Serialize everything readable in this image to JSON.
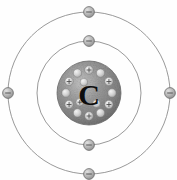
{
  "diagram": {
    "element_symbol": "C",
    "element_name": "Carbon",
    "background_color": "#fefefe",
    "canvas": {
      "width": 177,
      "height": 180
    },
    "center": {
      "x": 89,
      "y": 93
    }
  },
  "nucleus": {
    "label": "C",
    "radius": 32,
    "fill_color": "#8e8e8e",
    "edge_color": "#6f6f6f",
    "proton_count": 6,
    "neutron_count": 6,
    "proton_sign": "+",
    "nucleon_ring_radius": 23,
    "nucleon_radius": 4.2,
    "nucleon_fill": "#d6d6d6",
    "nucleons": [
      {
        "type": "proton",
        "angle": -90,
        "sign": "+"
      },
      {
        "type": "neutron",
        "angle": -60,
        "sign": ""
      },
      {
        "type": "proton",
        "angle": -30,
        "sign": "+"
      },
      {
        "type": "neutron",
        "angle": 0,
        "sign": ""
      },
      {
        "type": "proton",
        "angle": 30,
        "sign": "+"
      },
      {
        "type": "neutron",
        "angle": 60,
        "sign": ""
      },
      {
        "type": "proton",
        "angle": 90,
        "sign": "+"
      },
      {
        "type": "neutron",
        "angle": 120,
        "sign": ""
      },
      {
        "type": "proton",
        "angle": 150,
        "sign": "+"
      },
      {
        "type": "neutron",
        "angle": 180,
        "sign": ""
      },
      {
        "type": "proton",
        "angle": 210,
        "sign": "+"
      },
      {
        "type": "neutron",
        "angle": 240,
        "sign": ""
      }
    ],
    "inner_nucleons": [
      {
        "type": "neutron",
        "angle": -115,
        "radius": 12
      },
      {
        "type": "proton",
        "angle": 135,
        "radius": 13
      },
      {
        "type": "neutron",
        "angle": 55,
        "radius": 13
      }
    ]
  },
  "shells": [
    {
      "name": "inner-shell",
      "shell_number": 1,
      "radius": 52,
      "stroke_color": "#8d8d8d",
      "electron_count": 2,
      "electrons": [
        {
          "angle": -90,
          "label": "-"
        },
        {
          "angle": 90,
          "label": "-"
        }
      ]
    },
    {
      "name": "outer-shell",
      "shell_number": 2,
      "radius": 81,
      "stroke_color": "#8d8d8d",
      "electron_count": 4,
      "electrons": [
        {
          "angle": -90,
          "label": "-"
        },
        {
          "angle": 0,
          "label": "-"
        },
        {
          "angle": 90,
          "label": "-"
        },
        {
          "angle": 180,
          "label": "-"
        }
      ]
    }
  ],
  "electron": {
    "radius": 5.4,
    "fill_color": "#b9b9b9",
    "edge_color": "#6c6c6c",
    "sign": "-"
  }
}
